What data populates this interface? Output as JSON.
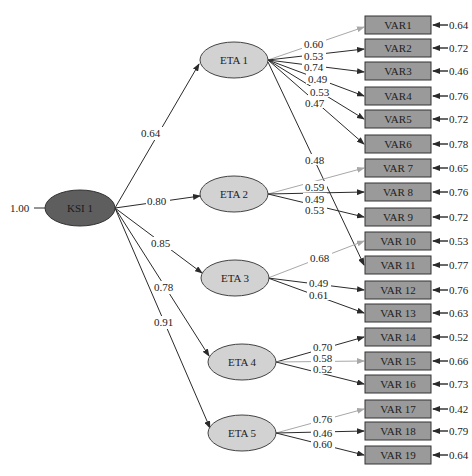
{
  "diagram": {
    "type": "structural-equation-model",
    "exogenous": {
      "id": "KSI 1",
      "variance_label": "1.00"
    },
    "latent": [
      {
        "id": "ETA 1",
        "path_from_ksi": "0.64"
      },
      {
        "id": "ETA 2",
        "path_from_ksi": "0.80"
      },
      {
        "id": "ETA 3",
        "path_from_ksi": "0.85"
      },
      {
        "id": "ETA 4",
        "path_from_ksi": "0.78"
      },
      {
        "id": "ETA 5",
        "path_from_ksi": "0.91"
      }
    ],
    "observed": [
      {
        "id": "VAR1",
        "error": "0.64"
      },
      {
        "id": "VAR2",
        "error": "0.72"
      },
      {
        "id": "VAR3",
        "error": "0.46"
      },
      {
        "id": "VAR4",
        "error": "0.76"
      },
      {
        "id": "VAR5",
        "error": "0.72"
      },
      {
        "id": "VAR6",
        "error": "0.78"
      },
      {
        "id": "VAR 7",
        "error": "0.65"
      },
      {
        "id": "VAR 8",
        "error": "0.76"
      },
      {
        "id": "VAR 9",
        "error": "0.72"
      },
      {
        "id": "VAR 10",
        "error": "0.53"
      },
      {
        "id": "VAR 11",
        "error": "0.77"
      },
      {
        "id": "VAR 12",
        "error": "0.76"
      },
      {
        "id": "VAR 13",
        "error": "0.63"
      },
      {
        "id": "VAR 14",
        "error": "0.52"
      },
      {
        "id": "VAR 15",
        "error": "0.66"
      },
      {
        "id": "VAR 16",
        "error": "0.73"
      },
      {
        "id": "VAR 17",
        "error": "0.42"
      },
      {
        "id": "VAR 18",
        "error": "0.79"
      },
      {
        "id": "VAR 19",
        "error": "0.64"
      }
    ],
    "loadings": [
      {
        "from": "ETA 1",
        "to": "VAR1",
        "value": "0.60"
      },
      {
        "from": "ETA 1",
        "to": "VAR2",
        "value": "0.53"
      },
      {
        "from": "ETA 1",
        "to": "VAR3",
        "value": "0.74"
      },
      {
        "from": "ETA 1",
        "to": "VAR4",
        "value": "0.49"
      },
      {
        "from": "ETA 1",
        "to": "VAR5",
        "value": "0.53"
      },
      {
        "from": "ETA 1",
        "to": "VAR6",
        "value": "0.47"
      },
      {
        "from": "ETA 1",
        "to": "VAR 11",
        "value": "0.48"
      },
      {
        "from": "ETA 2",
        "to": "VAR 7",
        "value": "0.59"
      },
      {
        "from": "ETA 2",
        "to": "VAR 8",
        "value": "0.49"
      },
      {
        "from": "ETA 2",
        "to": "VAR 9",
        "value": "0.53"
      },
      {
        "from": "ETA 3",
        "to": "VAR 10",
        "value": "0.68"
      },
      {
        "from": "ETA 3",
        "to": "VAR 12",
        "value": "0.49"
      },
      {
        "from": "ETA 3",
        "to": "VAR 13",
        "value": "0.61"
      },
      {
        "from": "ETA 4",
        "to": "VAR 14",
        "value": "0.70"
      },
      {
        "from": "ETA 4",
        "to": "VAR 15",
        "value": "0.58"
      },
      {
        "from": "ETA 4",
        "to": "VAR 16",
        "value": "0.52"
      },
      {
        "from": "ETA 5",
        "to": "VAR 17",
        "value": "0.76"
      },
      {
        "from": "ETA 5",
        "to": "VAR 18",
        "value": "0.46"
      },
      {
        "from": "ETA 5",
        "to": "VAR 19",
        "value": "0.60"
      }
    ],
    "colors": {
      "ksi_fill": "#5e5e5e",
      "eta_fill": "#d2d2d2",
      "var_fill": "#9a9a9a",
      "path_dark": "#2a2a2a",
      "path_light": "#a8a8a8"
    }
  }
}
